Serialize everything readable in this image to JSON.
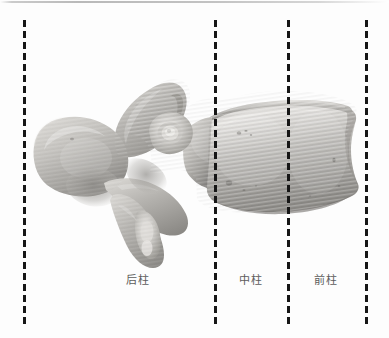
{
  "figure": {
    "title": "脊柱三柱结构示意图（腰椎侧面观）",
    "background_color": "#fdfdfd",
    "width": 389,
    "height": 338
  },
  "top_rule": {
    "color": "#b0b0b0"
  },
  "dividers": [
    {
      "id": "divider-1",
      "x": 24,
      "label": "posterior-boundary"
    },
    {
      "id": "divider-2",
      "x": 215,
      "label": "posterior-middle-boundary"
    },
    {
      "id": "divider-3",
      "x": 288,
      "label": "middle-anterior-boundary"
    },
    {
      "id": "divider-4",
      "x": 366,
      "label": "anterior-boundary"
    }
  ],
  "divider_style": {
    "color": "#161616",
    "dash_length": 7,
    "gap_length": 4,
    "width": 3,
    "top": 20,
    "bottom": 324
  },
  "columns": [
    {
      "id": "posterior-column",
      "label": "后柱",
      "center_x": 138,
      "y": 274
    },
    {
      "id": "middle-column",
      "label": "中柱",
      "center_x": 251,
      "y": 274
    },
    {
      "id": "anterior-column",
      "label": "前柱",
      "center_x": 326,
      "y": 274
    }
  ],
  "specimen": {
    "name": "lumbar-vertebra-lateral-view",
    "bone_light": "#e7e5e2",
    "bone_mid": "#b4b2ae",
    "bone_shadow": "#8d8b87",
    "bone_deep_shadow": "#6e6c68",
    "parts": [
      "spinous-process",
      "superior-articular-process",
      "transverse-process",
      "pedicle",
      "inferior-articular-process",
      "vertebral-body"
    ]
  }
}
